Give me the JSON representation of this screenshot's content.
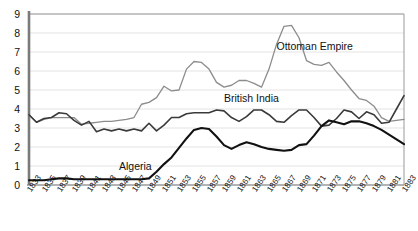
{
  "chart_data": {
    "type": "line",
    "title": "",
    "subtitle": "",
    "xlabel": "",
    "ylabel": "",
    "xlim": [
      1833,
      1883
    ],
    "ylim": [
      0,
      9
    ],
    "yticks": [
      0,
      1,
      2,
      3,
      4,
      5,
      6,
      7,
      8,
      9
    ],
    "grid": true,
    "grid_axis": "y",
    "legend_position": "inline-annotation",
    "x": [
      1833,
      1834,
      1835,
      1836,
      1837,
      1838,
      1839,
      1840,
      1841,
      1842,
      1843,
      1844,
      1845,
      1846,
      1847,
      1848,
      1849,
      1850,
      1851,
      1852,
      1853,
      1854,
      1855,
      1856,
      1857,
      1858,
      1859,
      1860,
      1861,
      1862,
      1863,
      1864,
      1865,
      1866,
      1867,
      1868,
      1869,
      1870,
      1871,
      1872,
      1873,
      1874,
      1875,
      1876,
      1877,
      1878,
      1879,
      1880,
      1881,
      1882,
      1883
    ],
    "xticks": [
      1833,
      1835,
      1837,
      1839,
      1841,
      1843,
      1845,
      1847,
      1849,
      1851,
      1853,
      1855,
      1857,
      1859,
      1861,
      1863,
      1865,
      1867,
      1869,
      1871,
      1873,
      1875,
      1877,
      1879,
      1881,
      1883
    ],
    "series": [
      {
        "name": "Ottoman Empire",
        "color": "#8c8c8c",
        "width": 1.3,
        "label_x": 1866,
        "label_y": 7.25,
        "values": [
          3.7,
          3.3,
          3.45,
          3.55,
          3.55,
          3.55,
          3.55,
          3.2,
          3.25,
          3.3,
          3.35,
          3.35,
          3.4,
          3.45,
          3.55,
          4.25,
          4.35,
          4.6,
          5.2,
          4.95,
          5.0,
          6.1,
          6.5,
          6.45,
          6.1,
          5.4,
          5.15,
          5.25,
          5.5,
          5.5,
          5.35,
          5.15,
          6.1,
          7.4,
          8.35,
          8.4,
          7.75,
          6.55,
          6.35,
          6.3,
          6.45,
          5.95,
          5.5,
          5.0,
          4.55,
          4.45,
          4.15,
          3.55,
          3.35,
          3.4,
          3.45
        ]
      },
      {
        "name": "British India",
        "color": "#3a3a3a",
        "width": 1.6,
        "label_x": 1859,
        "label_y": 4.55,
        "values": [
          3.7,
          3.3,
          3.5,
          3.55,
          3.8,
          3.75,
          3.4,
          3.15,
          3.35,
          2.8,
          2.95,
          2.85,
          2.95,
          2.85,
          2.95,
          2.85,
          3.25,
          2.85,
          3.15,
          3.55,
          3.55,
          3.75,
          3.8,
          3.8,
          3.8,
          3.95,
          3.9,
          3.55,
          3.35,
          3.6,
          3.95,
          3.95,
          3.7,
          3.35,
          3.3,
          3.65,
          3.95,
          3.95,
          3.55,
          3.1,
          3.15,
          3.5,
          3.95,
          3.85,
          3.5,
          3.85,
          3.7,
          3.25,
          3.3,
          4.0,
          4.7
        ]
      },
      {
        "name": "Algeria",
        "color": "#111111",
        "width": 2.1,
        "label_x": 1845,
        "label_y": 0.95,
        "values": [
          0.25,
          0.25,
          0.25,
          0.3,
          0.35,
          0.35,
          0.3,
          0.3,
          0.3,
          0.3,
          0.3,
          0.3,
          0.3,
          0.3,
          0.3,
          0.3,
          0.35,
          0.7,
          1.1,
          1.45,
          1.95,
          2.45,
          2.9,
          3.0,
          2.95,
          2.55,
          2.1,
          1.9,
          2.1,
          2.25,
          2.15,
          2.0,
          1.9,
          1.85,
          1.8,
          1.85,
          2.1,
          2.15,
          2.6,
          3.1,
          3.4,
          3.3,
          3.2,
          3.35,
          3.35,
          3.25,
          3.1,
          2.9,
          2.65,
          2.4,
          2.15
        ]
      }
    ]
  },
  "axis": {
    "y_axis_color": "#7a7a7a",
    "x_axis_color": "#9a9a9a",
    "grid_color": "#e3e3e3",
    "border_color": "#9a9a9a"
  }
}
